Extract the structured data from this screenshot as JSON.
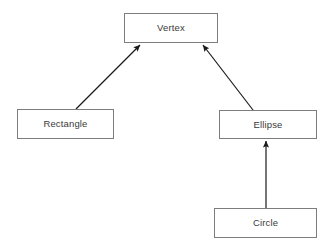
{
  "diagram": {
    "type": "class-inheritance-diagram",
    "notation": "uml-generalization",
    "canvas": {
      "width": 335,
      "height": 250,
      "background": "#ffffff"
    },
    "style": {
      "box_fill": "#ffffff",
      "box_border_color": "#7d7d7d",
      "box_border_width": 1,
      "label_color": "#3a3a3a",
      "label_font_size": 9.5,
      "edge_color": "#1a1a1a",
      "edge_width": 1.2,
      "arrowhead_style": "solid-filled-triangle"
    },
    "nodes": [
      {
        "id": "vertex",
        "label": "Vertex",
        "role": "base-class",
        "x": 124,
        "y": 13,
        "width": 94,
        "height": 30
      },
      {
        "id": "rectangle",
        "label": "Rectangle",
        "role": "derived-class",
        "x": 17,
        "y": 109,
        "width": 97,
        "height": 30
      },
      {
        "id": "ellipse",
        "label": "Ellipse",
        "role": "derived-class",
        "x": 219,
        "y": 110,
        "width": 98,
        "height": 29
      },
      {
        "id": "circle",
        "label": "Circle",
        "role": "derived-class",
        "x": 214,
        "y": 208,
        "width": 103,
        "height": 30
      }
    ],
    "edges": [
      {
        "id": "rectangle-to-vertex",
        "from": "rectangle",
        "to": "vertex",
        "relation": "inherits-from",
        "x1": 76,
        "y1": 109,
        "x2": 140,
        "y2": 45
      },
      {
        "id": "ellipse-to-vertex",
        "from": "ellipse",
        "to": "vertex",
        "relation": "inherits-from",
        "x1": 253,
        "y1": 110,
        "x2": 203,
        "y2": 45
      },
      {
        "id": "circle-to-ellipse",
        "from": "circle",
        "to": "ellipse",
        "relation": "inherits-from",
        "x1": 266,
        "y1": 208,
        "x2": 266,
        "y2": 141
      }
    ]
  }
}
